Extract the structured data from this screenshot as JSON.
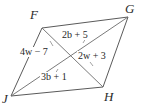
{
  "figure": {
    "type": "parallelogram-with-diagonals",
    "name": "FGHJ",
    "background_color": "#ffffff",
    "stroke_color": "#5a5a5a",
    "text_color": "#1f1f1f",
    "vertices": [
      {
        "id": "F",
        "label": "F",
        "x": 42,
        "y": 28
      },
      {
        "id": "G",
        "label": "G",
        "x": 128,
        "y": 17
      },
      {
        "id": "H",
        "label": "H",
        "x": 103,
        "y": 87
      },
      {
        "id": "J",
        "label": "J",
        "x": 11,
        "y": 96
      }
    ],
    "center": {
      "x": 70,
      "y": 57
    },
    "sides": [
      {
        "from": "F",
        "to": "G"
      },
      {
        "from": "G",
        "to": "H"
      },
      {
        "from": "H",
        "to": "J"
      },
      {
        "from": "J",
        "to": "F"
      }
    ],
    "diagonals": [
      {
        "from": "F",
        "to": "H"
      },
      {
        "from": "J",
        "to": "G"
      }
    ],
    "segment_labels": [
      {
        "id": "top",
        "text": "2b + 5",
        "segment": "GK",
        "diagonal": "JG"
      },
      {
        "id": "left",
        "text": "4w − 7",
        "segment": "FK",
        "diagonal": "FH"
      },
      {
        "id": "right",
        "text": "2w + 3",
        "segment": "KH",
        "diagonal": "FH"
      },
      {
        "id": "bottom",
        "text": "3b + 1",
        "segment": "JK",
        "diagonal": "JG"
      }
    ]
  }
}
